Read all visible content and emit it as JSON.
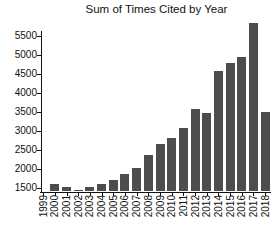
{
  "chart_data": {
    "type": "bar",
    "title": "Sum of Times Cited by Year",
    "xlabel": "",
    "ylabel": "",
    "categories": [
      "1999",
      "2000",
      "2001",
      "2002",
      "2003",
      "2004",
      "2005",
      "2006",
      "2007",
      "2008",
      "2009",
      "2010",
      "2011",
      "2012",
      "2013",
      "2014",
      "2015",
      "2016",
      "2017",
      "2018"
    ],
    "values": [
      1400,
      1600,
      1510,
      1440,
      1530,
      1590,
      1710,
      1870,
      2020,
      2370,
      2640,
      2820,
      3080,
      3560,
      3470,
      4570,
      4780,
      4940,
      5830,
      3500
    ],
    "ylim": [
      1400,
      5900
    ],
    "yticks": [
      1500,
      2000,
      2500,
      3000,
      3500,
      4000,
      4500,
      5000,
      5500
    ],
    "grid": false,
    "legend": null,
    "bar_color": "#4d4d4d",
    "axis_color": "#111111",
    "x_tick_label_rotation": -90
  }
}
